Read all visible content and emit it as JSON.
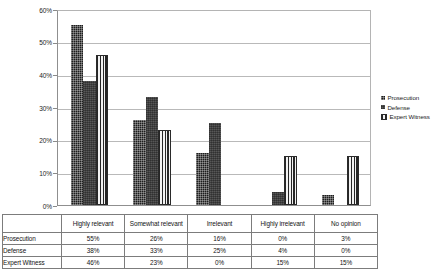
{
  "chart_data": {
    "type": "bar",
    "title": "",
    "subtitle": "",
    "xlabel": "",
    "ylabel": "",
    "ylim": [
      0,
      60
    ],
    "y_tick_labels": [
      "60%",
      "50%",
      "40%",
      "30%",
      "20%",
      "10%",
      "0%"
    ],
    "y_tick_values": [
      60,
      50,
      40,
      30,
      20,
      10,
      0
    ],
    "grid": true,
    "legend_position": "right",
    "categories": [
      "Highly relevant",
      "Somewhat relevant",
      "Irrelevant",
      "Highly irrelevant",
      "No opinion"
    ],
    "series": [
      {
        "name": "Prosecution",
        "values": [
          55,
          26,
          16,
          0,
          3
        ],
        "labels": [
          "55%",
          "26%",
          "16%",
          "0%",
          "3%"
        ],
        "color": "#1d1d1d",
        "pattern": "checkered"
      },
      {
        "name": "Defense",
        "values": [
          38,
          33,
          25,
          4,
          0
        ],
        "labels": [
          "38%",
          "33%",
          "25%",
          "4%",
          "0%"
        ],
        "color": "#575757",
        "pattern": "dotted"
      },
      {
        "name": "Expert Witness",
        "values": [
          46,
          23,
          0,
          15,
          15
        ],
        "labels": [
          "46%",
          "23%",
          "0%",
          "15%",
          "15%"
        ],
        "color": "#262626",
        "pattern": "vertical-stripes"
      }
    ]
  },
  "legend": {
    "entries": [
      {
        "label": "Prosecution"
      },
      {
        "label": "Defense"
      },
      {
        "label": "Expert Witness"
      }
    ]
  },
  "table": {
    "corner_label": "",
    "column_headers": [
      "Highly relevant",
      "Somewhat relevant",
      "Irrelevant",
      "Highly irrelevant",
      "No opinion"
    ],
    "rows": [
      {
        "label": "Prosecution",
        "values": [
          "55%",
          "26%",
          "16%",
          "0%",
          "3%"
        ]
      },
      {
        "label": "Defense",
        "values": [
          "38%",
          "33%",
          "25%",
          "4%",
          "0%"
        ]
      },
      {
        "label": "Expert Witness",
        "values": [
          "46%",
          "23%",
          "0%",
          "15%",
          "15%"
        ]
      }
    ]
  }
}
